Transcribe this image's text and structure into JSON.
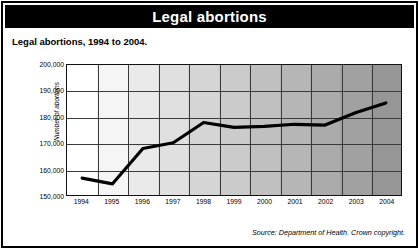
{
  "header": {
    "title": "Legal abortions"
  },
  "subtitle": "Legal abortions, 1994 to 2004.",
  "source": "Source: Department of Health. Crown copyright.",
  "colors": {
    "title_bar_bg": "#000000",
    "title_bar_text": "#ffffff",
    "frame": "#000000",
    "grid": "#3a3a3a",
    "line": "#000000",
    "plot_bg_start": "#ffffff",
    "plot_bg_end": "#9a9a9a"
  },
  "chart_data": {
    "type": "line",
    "title": "Legal abortions, 1994 to 2004.",
    "xlabel": "",
    "ylabel": "Number of abortions",
    "categories": [
      "1994",
      "1995",
      "1996",
      "1997",
      "1998",
      "1999",
      "2000",
      "2001",
      "2002",
      "2003",
      "2004"
    ],
    "values": [
      156500,
      154300,
      167900,
      170100,
      177900,
      176000,
      176400,
      177200,
      176900,
      181600,
      185400
    ],
    "ylim": [
      150000,
      200000
    ],
    "yticks": [
      "150,000",
      "160,000",
      "170,000",
      "180,000",
      "190,000",
      "200,000"
    ],
    "ytick_values": [
      150000,
      160000,
      170000,
      180000,
      190000,
      200000
    ],
    "grid": true,
    "legend": "none",
    "series": [
      {
        "name": "Number of abortions",
        "values": [
          156500,
          154300,
          167900,
          170100,
          177900,
          176000,
          176400,
          177200,
          176900,
          181600,
          185400
        ]
      }
    ]
  }
}
